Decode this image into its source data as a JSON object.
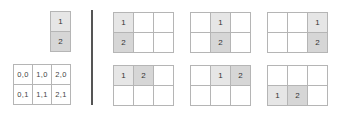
{
  "item": {
    "label_1": "1",
    "label_2": "2"
  },
  "base_grid": {
    "rows": [
      [
        "0,0",
        "1,0",
        "2,0"
      ],
      [
        "0,1",
        "1,1",
        "2,1"
      ]
    ]
  },
  "placements": [
    {
      "description": "vertical at column 0",
      "cells": {
        "0,0": "1",
        "0,1": "2"
      }
    },
    {
      "description": "vertical at column 1",
      "cells": {
        "1,0": "1",
        "1,1": "2"
      }
    },
    {
      "description": "vertical at column 2",
      "cells": {
        "2,0": "1",
        "2,1": "2"
      }
    },
    {
      "description": "horizontal at row 0, col 0",
      "cells": {
        "0,0": "1",
        "1,0": "2"
      }
    },
    {
      "description": "horizontal at row 0, col 1",
      "cells": {
        "1,0": "1",
        "2,0": "2"
      }
    },
    {
      "description": "horizontal at row 1, col 0",
      "cells": {
        "0,1": "1",
        "1,1": "2"
      }
    }
  ],
  "colors": {
    "cell_1": "#e6e6e6",
    "cell_2": "#d6d6d6",
    "border": "#b5b5b5",
    "divider": "#555555"
  }
}
